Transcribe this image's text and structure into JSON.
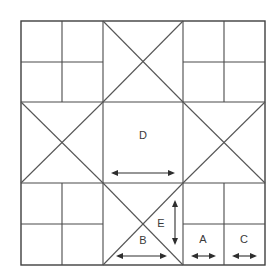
{
  "diagram": {
    "type": "quilt-block-piecing-diagram",
    "canvas": {
      "width": 280,
      "height": 279,
      "background": "#ffffff"
    },
    "colors": {
      "line": "#4a4a4a",
      "outline": "#3f3f3f",
      "diagonal": "#565656",
      "arrow": "#2e2e2e",
      "label": "#3a3a3a"
    },
    "block": {
      "outer": {
        "x": 21,
        "y": 21,
        "width": 244,
        "height": 244
      },
      "vertical_grid_x": [
        21,
        62,
        103,
        183,
        224,
        265
      ],
      "horizontal_grid_y": [
        21,
        62,
        102,
        183,
        224,
        265
      ],
      "columns": [
        {
          "name": "left-band",
          "x0": 21,
          "x1": 103
        },
        {
          "name": "center-band",
          "x0": 103,
          "x1": 183
        },
        {
          "name": "right-band",
          "x0": 183,
          "x1": 265
        }
      ],
      "rows": [
        {
          "name": "top-band",
          "y0": 21,
          "y1": 102
        },
        {
          "name": "middle-band",
          "y0": 102,
          "y1": 183
        },
        {
          "name": "bottom-band",
          "y0": 183,
          "y1": 265
        }
      ],
      "units": [
        {
          "id": "top-left",
          "kind": "four-patch",
          "x": 21,
          "y": 21,
          "w": 82,
          "h": 81
        },
        {
          "id": "top-center",
          "kind": "x-block",
          "x": 103,
          "y": 21,
          "w": 80,
          "h": 81
        },
        {
          "id": "top-right",
          "kind": "four-patch",
          "x": 183,
          "y": 21,
          "w": 82,
          "h": 81
        },
        {
          "id": "middle-left",
          "kind": "x-block",
          "x": 21,
          "y": 102,
          "w": 82,
          "h": 81
        },
        {
          "id": "center",
          "kind": "plain-square",
          "x": 103,
          "y": 102,
          "w": 80,
          "h": 81,
          "label": "D"
        },
        {
          "id": "middle-right",
          "kind": "x-block",
          "x": 183,
          "y": 102,
          "w": 82,
          "h": 81
        },
        {
          "id": "bottom-left",
          "kind": "four-patch",
          "x": 21,
          "y": 183,
          "w": 82,
          "h": 82
        },
        {
          "id": "bottom-center",
          "kind": "x-block",
          "x": 103,
          "y": 183,
          "w": 80,
          "h": 82
        },
        {
          "id": "bottom-right",
          "kind": "four-patch",
          "x": 183,
          "y": 183,
          "w": 82,
          "h": 82
        }
      ]
    },
    "labels": [
      {
        "id": "label-d",
        "text": "D",
        "x": 143,
        "y": 136
      },
      {
        "id": "label-e",
        "text": "E",
        "x": 161,
        "y": 224
      },
      {
        "id": "label-b",
        "text": "B",
        "x": 143,
        "y": 241
      },
      {
        "id": "label-a",
        "text": "A",
        "x": 203,
        "y": 240
      },
      {
        "id": "label-c",
        "text": "C",
        "x": 244,
        "y": 240
      }
    ],
    "dimensions": [
      {
        "id": "dimension-d",
        "for": "D",
        "orientation": "horizontal",
        "x1": 111,
        "x2": 175,
        "y": 173
      },
      {
        "id": "dimension-e",
        "for": "E",
        "orientation": "vertical",
        "x": 175,
        "y1": 200,
        "y2": 245
      },
      {
        "id": "dimension-b",
        "for": "B",
        "orientation": "horizontal",
        "x1": 116,
        "x2": 167,
        "y": 256
      },
      {
        "id": "dimension-a",
        "for": "A",
        "orientation": "horizontal",
        "x1": 191,
        "x2": 216,
        "y": 256
      },
      {
        "id": "dimension-c",
        "for": "C",
        "orientation": "horizontal",
        "x1": 232,
        "x2": 257,
        "y": 256
      }
    ]
  }
}
